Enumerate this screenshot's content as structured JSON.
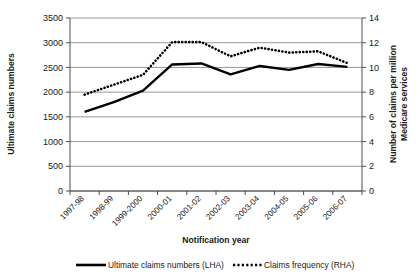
{
  "chart_data": {
    "type": "line",
    "title": "",
    "subtitle": "",
    "xlabel": "Notification year",
    "ylabel": "Ultimate claims numbers",
    "y2label": "Number of claims per million Medicare services",
    "y2label_line1": "Number of claims per million",
    "y2label_line2": "Medicare services",
    "categories": [
      "1997-98",
      "1998-99",
      "1999-2000",
      "2000-01",
      "2001-02",
      "2002-03",
      "2003-04",
      "2004-05",
      "2005-06",
      "2006-07"
    ],
    "ylim": [
      0,
      3500
    ],
    "yticks": [
      0,
      500,
      1000,
      1500,
      2000,
      2500,
      3000,
      3500
    ],
    "ytick_labels": [
      "0",
      "500",
      "1000",
      "1500",
      "2000",
      "2500",
      "3000",
      "3500"
    ],
    "y2lim": [
      0,
      14
    ],
    "y2ticks": [
      0,
      2,
      4,
      6,
      8,
      10,
      12,
      14
    ],
    "y2tick_labels": [
      "0",
      "2",
      "4",
      "6",
      "8",
      "10",
      "12",
      "14"
    ],
    "grid": true,
    "legend_position": "bottom",
    "series": [
      {
        "name": "Ultimate claims numbers (LHA)",
        "axis": "left",
        "style": "solid",
        "color": "#000000",
        "values": [
          1600,
          1800,
          2030,
          2560,
          2580,
          2360,
          2530,
          2450,
          2570,
          2510
        ]
      },
      {
        "name": "Claims frequency (RHA)",
        "axis": "right",
        "style": "dotted",
        "color": "#000000",
        "values": [
          7.8,
          8.6,
          9.4,
          12.05,
          12.05,
          10.9,
          11.6,
          11.2,
          11.3,
          10.35
        ]
      }
    ],
    "legend": [
      {
        "label": "Ultimate claims numbers (LHA)",
        "style": "solid"
      },
      {
        "label": "Claims frequency (RHA)",
        "style": "dotted"
      }
    ]
  },
  "colors": {
    "axis": "#4d4d4d",
    "grid": "#8c8c8c",
    "series": "#000000",
    "background": "#ffffff"
  }
}
